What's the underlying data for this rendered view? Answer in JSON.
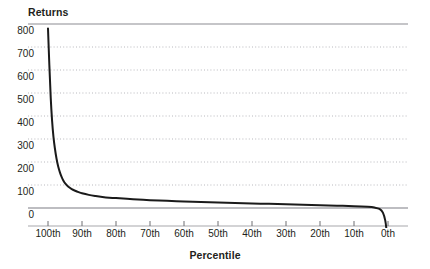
{
  "chart_data": {
    "type": "line",
    "title": "",
    "ylabel": "Returns",
    "xlabel": "Percentile",
    "ylim": [
      -150,
      800
    ],
    "grid": true,
    "legend": null,
    "y_ticks": [
      800,
      700,
      600,
      500,
      400,
      300,
      200,
      100,
      0
    ],
    "y_tick_labels": [
      "800",
      "700",
      "600",
      "500",
      "400",
      "300",
      "200",
      "100",
      "0"
    ],
    "x_ticks": [
      100,
      90,
      80,
      70,
      60,
      50,
      40,
      30,
      20,
      10,
      0
    ],
    "x_tick_labels": [
      "100th",
      "90th",
      "80th",
      "70th",
      "60th",
      "50th",
      "40th",
      "30th",
      "20th",
      "10th",
      "0th"
    ],
    "x_axis_direction": "descending",
    "series": [
      {
        "name": "Returns by percentile",
        "color": "#1a1a1a",
        "x": [
          100,
          99.6,
          99.2,
          98.8,
          98.4,
          98,
          97.5,
          97,
          96.5,
          96,
          95.5,
          95,
          94,
          93,
          92,
          91,
          90,
          88,
          86,
          84,
          82,
          80,
          75,
          70,
          65,
          60,
          55,
          50,
          45,
          40,
          35,
          30,
          25,
          20,
          15,
          10,
          6,
          4,
          2.5,
          1.5,
          0.8,
          0.4,
          0
        ],
        "y": [
          780,
          620,
          480,
          380,
          310,
          262,
          215,
          180,
          155,
          135,
          120,
          108,
          92,
          82,
          75,
          69,
          64,
          57,
          52,
          48,
          45,
          43,
          38,
          34,
          31,
          28,
          26,
          24,
          22,
          20,
          18,
          16,
          14,
          12,
          10,
          8,
          5,
          2,
          -4,
          -20,
          -55,
          -100,
          -150
        ]
      }
    ],
    "annotations": [
      {
        "label": "zero-baseline",
        "y": 0
      },
      {
        "label": "top-rule",
        "y": 800
      }
    ]
  },
  "colors": {
    "line": "#1a1a1a",
    "gridline": "#b8b8bd",
    "baseline": "#a7a7ac",
    "top_rule": "#8c8c91",
    "axis": "#a7a7ac",
    "tick": "#6e6e73",
    "text": "#231f20",
    "background": "#ffffff"
  }
}
